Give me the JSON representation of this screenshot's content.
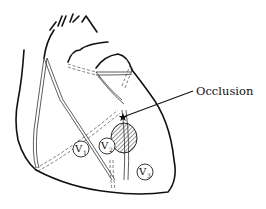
{
  "diagram": {
    "labels": {
      "occlusion": "Occlusion"
    },
    "leads": [
      {
        "letter": "V",
        "sub": "1",
        "cx": 81,
        "cy": 149
      },
      {
        "letter": "V",
        "sub": "2",
        "cx": 107,
        "cy": 146
      },
      {
        "letter": "V",
        "sub": "3",
        "cx": 145,
        "cy": 172
      }
    ],
    "colors": {
      "line": "#111111",
      "background": "#ffffff"
    }
  }
}
